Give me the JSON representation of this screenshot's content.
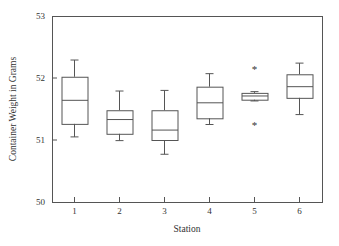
{
  "chart_data": {
    "type": "box",
    "title": "",
    "xlabel": "Station",
    "ylabel": "Container Weight in Grams",
    "categories": [
      "1",
      "2",
      "3",
      "4",
      "5",
      "6"
    ],
    "xtick_labels": [
      "1",
      "2",
      "3",
      "4",
      "5",
      "6"
    ],
    "ytick_labels": [
      "50",
      "51",
      "52",
      "53"
    ],
    "yticks": [
      50,
      51,
      52,
      53
    ],
    "ylim": [
      50,
      53
    ],
    "xlim": [
      0.5,
      6.5
    ],
    "grid": false,
    "legend": null,
    "boxes": [
      {
        "category": "1",
        "whisker_low": 51.05,
        "q1": 51.26,
        "median": 51.64,
        "q3": 52.02,
        "whisker_high": 52.29,
        "outliers": []
      },
      {
        "category": "2",
        "whisker_low": 50.99,
        "q1": 51.1,
        "median": 51.33,
        "q3": 51.48,
        "whisker_high": 51.79,
        "outliers": []
      },
      {
        "category": "3",
        "whisker_low": 50.77,
        "q1": 51.0,
        "median": 51.16,
        "q3": 51.48,
        "whisker_high": 51.8,
        "outliers": []
      },
      {
        "category": "4",
        "whisker_low": 51.25,
        "q1": 51.35,
        "median": 51.6,
        "q3": 51.86,
        "whisker_high": 52.07,
        "outliers": []
      },
      {
        "category": "5",
        "whisker_low": 51.63,
        "q1": 51.65,
        "median": 51.71,
        "q3": 51.76,
        "whisker_high": 51.78,
        "outliers": [
          52.15,
          51.24
        ]
      },
      {
        "category": "6",
        "whisker_low": 51.41,
        "q1": 51.68,
        "median": 51.86,
        "q3": 52.06,
        "whisker_high": 52.24,
        "outliers": []
      }
    ],
    "colors": {
      "line": "#555555",
      "text": "#333333",
      "background": "#ffffff"
    },
    "outlier_marker": "*"
  },
  "geometry": {
    "plot_left": 52,
    "plot_right": 322,
    "plot_top": 16,
    "plot_bottom": 202,
    "box_half_width": 13
  }
}
